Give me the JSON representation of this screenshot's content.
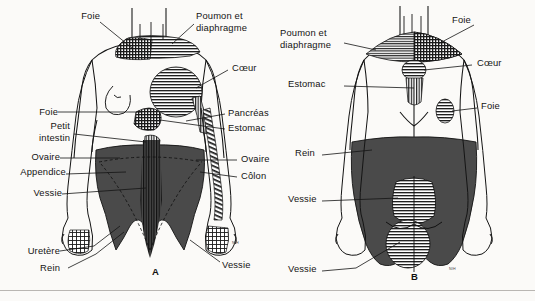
{
  "plate": {
    "title": "Zones de douleur projetee - vues anterieure et posterieure",
    "panel_a_letter": "A",
    "panel_b_letter": "B",
    "signature": "NIH",
    "colors": {
      "ink": "#141414",
      "page": "#fbfaf8",
      "dark_zone": "#4a4a4a",
      "hatch": "#1f1f1f",
      "rule": "#b9b6b2"
    }
  },
  "panel_a": {
    "view": "anterior",
    "letter": "A",
    "labels_left": [
      {
        "name": "foie-shoulder",
        "text": "Foie",
        "x": 78,
        "y": 16
      },
      {
        "name": "foie-abdomen",
        "text": "Foie",
        "x": 36,
        "y": 112
      },
      {
        "name": "petit-intestin-line1",
        "text": "Petit",
        "x": 46,
        "y": 126
      },
      {
        "name": "petit-intestin-line2",
        "text": "intestin",
        "x": 38,
        "y": 138
      },
      {
        "name": "ovaire-left",
        "text": "Ovaire",
        "x": 30,
        "y": 157
      },
      {
        "name": "appendice",
        "text": "Appendice",
        "x": 16,
        "y": 172
      },
      {
        "name": "vessie-left",
        "text": "Vessie",
        "x": 32,
        "y": 192
      },
      {
        "name": "uretere",
        "text": "Uretère",
        "x": 28,
        "y": 250
      },
      {
        "name": "rein-left",
        "text": "Rein",
        "x": 46,
        "y": 267
      }
    ],
    "labels_right": [
      {
        "name": "poumon-diaphragme-line1",
        "text": "Poumon et",
        "x": 196,
        "y": 16
      },
      {
        "name": "poumon-diaphragme-line2",
        "text": "diaphragme",
        "x": 196,
        "y": 28
      },
      {
        "name": "coeur",
        "text": "Cœur",
        "x": 232,
        "y": 68
      },
      {
        "name": "pancreas",
        "text": "Pancréas",
        "x": 228,
        "y": 112
      },
      {
        "name": "estomac",
        "text": "Estomac",
        "x": 228,
        "y": 127
      },
      {
        "name": "ovaire-right",
        "text": "Ovaire",
        "x": 240,
        "y": 158
      },
      {
        "name": "colon",
        "text": "Côlon",
        "x": 240,
        "y": 175
      },
      {
        "name": "vessie-right",
        "text": "Vessie",
        "x": 222,
        "y": 265
      }
    ]
  },
  "panel_b": {
    "view": "posterior",
    "letter": "B",
    "labels_left": [
      {
        "name": "poumon-diaphragme-line1",
        "text": "Poumon et",
        "x": 280,
        "y": 33
      },
      {
        "name": "poumon-diaphragme-line2",
        "text": "diaphragme",
        "x": 280,
        "y": 45
      },
      {
        "name": "estomac",
        "text": "Estomac",
        "x": 288,
        "y": 83
      },
      {
        "name": "rein",
        "text": "Rein",
        "x": 295,
        "y": 152
      },
      {
        "name": "vessie-upper",
        "text": "Vessie",
        "x": 288,
        "y": 198
      },
      {
        "name": "vessie-lower",
        "text": "Vessie",
        "x": 288,
        "y": 268
      }
    ],
    "labels_right": [
      {
        "name": "foie-shoulder",
        "text": "Foie",
        "x": 452,
        "y": 20
      },
      {
        "name": "coeur",
        "text": "Cœur",
        "x": 476,
        "y": 63
      },
      {
        "name": "foie-flank",
        "text": "Foie",
        "x": 480,
        "y": 106
      }
    ]
  }
}
